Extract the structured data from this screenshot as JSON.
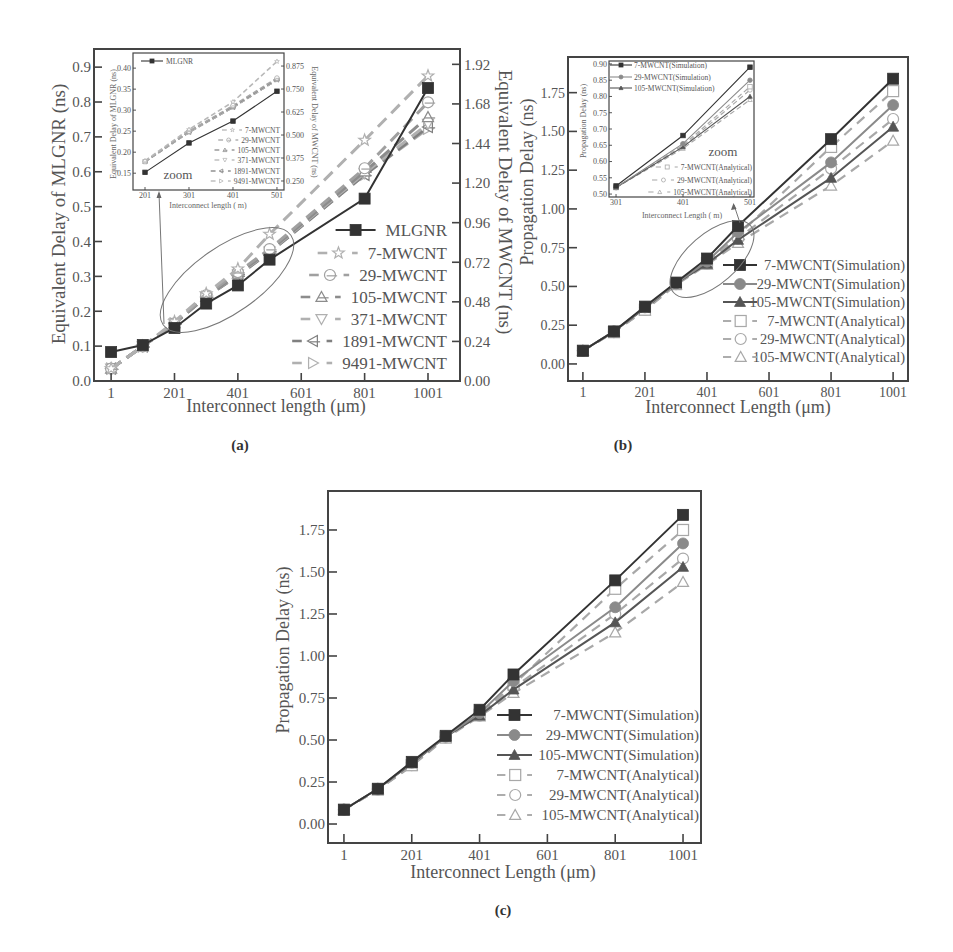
{
  "chart_data": [
    {
      "id": "a",
      "type": "line",
      "panel_label": "(a)",
      "xlabel": "Interconnect length (μm)",
      "ylabel": "Equivalent Delay of MLGNR (ns)",
      "y2label": "Equivalent Delay of MWCNT (ns)",
      "grid": false,
      "legend_position": "lower right",
      "xlim": [
        -53,
        1102
      ],
      "ylim": [
        0,
        0.952
      ],
      "y2lim": [
        0,
        2.013
      ],
      "xticks": [
        1,
        201,
        401,
        601,
        801,
        1001
      ],
      "xtick_labels": [
        "1",
        "201",
        "401",
        "601",
        "801",
        "1001"
      ],
      "yticks": [
        0,
        0.1,
        0.2,
        0.3,
        0.4,
        0.5,
        0.6,
        0.7,
        0.8,
        0.9
      ],
      "ytick_labels": [
        "0.0",
        "0.1",
        "0.2",
        "0.3",
        "0.4",
        "0.5",
        "0.6",
        "0.7",
        "0.8",
        "0.9"
      ],
      "y2ticks": [
        0,
        0.24,
        0.48,
        0.72,
        0.96,
        1.2,
        1.44,
        1.68,
        1.92
      ],
      "y2tick_labels": [
        "0.00",
        "0.24",
        "0.48",
        "0.72",
        "0.96",
        "1.20",
        "1.44",
        "1.68",
        "1.92"
      ],
      "x": [
        1,
        101,
        201,
        301,
        401,
        501,
        801,
        1001
      ],
      "series": [
        {
          "name": "MLGNR",
          "axis": "y",
          "values": [
            0.083,
            0.103,
            0.152,
            0.222,
            0.274,
            0.348,
            0.523,
            0.84
          ],
          "marker": "square",
          "line": "solid",
          "color": "#333333"
        },
        {
          "name": "7-MWCNT",
          "axis": "y2",
          "values": [
            0.075,
            0.21,
            0.36,
            0.53,
            0.68,
            0.89,
            1.46,
            1.85
          ],
          "marker": "star-open",
          "line": "dashed",
          "color": "#b0b0b0"
        },
        {
          "name": "29-MWCNT",
          "axis": "y2",
          "values": [
            0.075,
            0.21,
            0.35,
            0.52,
            0.66,
            0.8,
            1.29,
            1.69
          ],
          "marker": "circle-open-bar",
          "line": "dashed",
          "color": "#a0a0a0"
        },
        {
          "name": "105-MWCNT",
          "axis": "y2",
          "values": [
            0.075,
            0.21,
            0.35,
            0.51,
            0.65,
            0.79,
            1.27,
            1.6
          ],
          "marker": "triangle-up-open-bar",
          "line": "dashed",
          "color": "#8c8c8c"
        },
        {
          "name": "371-MWCNT",
          "axis": "y2",
          "values": [
            0.075,
            0.21,
            0.35,
            0.51,
            0.645,
            0.785,
            1.26,
            1.56
          ],
          "marker": "triangle-down-open",
          "line": "dashed",
          "color": "#b0b0b0"
        },
        {
          "name": "1891-MWCNT",
          "axis": "y2",
          "values": [
            0.075,
            0.21,
            0.35,
            0.51,
            0.64,
            0.78,
            1.25,
            1.54
          ],
          "marker": "triangle-left-open-bar",
          "line": "dashed",
          "color": "#808080"
        },
        {
          "name": "9491-MWCNT",
          "axis": "y2",
          "values": [
            0.075,
            0.21,
            0.35,
            0.51,
            0.64,
            0.78,
            1.25,
            1.53
          ],
          "marker": "triangle-right-open",
          "line": "dashed",
          "color": "#b0b0b0"
        }
      ],
      "inset": {
        "id": "a-inset",
        "type": "line",
        "annotation": "zoom",
        "xlabel": "Interconnect length ( m)",
        "ylabel": "Equivalent Delay of MLGNR (ns)",
        "y2label": "Equivalent Delay of MWCNT (ns)",
        "xlim": [
          173.7,
          517
        ],
        "ylim": [
          0.11,
          0.436
        ],
        "y2lim": [
          0.201,
          0.946
        ],
        "xticks": [
          201,
          301,
          401,
          501
        ],
        "xtick_labels": [
          "201",
          "301",
          "401",
          "501"
        ],
        "yticks": [
          0.15,
          0.2,
          0.25,
          0.3,
          0.35,
          0.4
        ],
        "ytick_labels": [
          "0.15",
          "0.20",
          "0.25",
          "0.30",
          "0.35",
          "0.40"
        ],
        "y2ticks": [
          0.25,
          0.375,
          0.5,
          0.625,
          0.75,
          0.875
        ],
        "y2tick_labels": [
          "0.250",
          "0.375",
          "0.500",
          "0.625",
          "0.750",
          "0.875"
        ],
        "x": [
          201,
          301,
          401,
          501
        ],
        "series": [
          {
            "name": "MLGNR",
            "axis": "y",
            "values": [
              0.152,
              0.222,
              0.274,
              0.345
            ],
            "marker": "square",
            "line": "solid",
            "color": "#333333"
          },
          {
            "name": "7-MWCNT",
            "axis": "y2",
            "values": [
              0.36,
              0.53,
              0.68,
              0.9
            ],
            "marker": "star-open",
            "line": "dashed",
            "color": "#b8b8b8"
          },
          {
            "name": "29-MWCNT",
            "axis": "y2",
            "values": [
              0.355,
              0.52,
              0.66,
              0.81
            ],
            "marker": "circle-open-bar",
            "line": "dashed",
            "color": "#a8a8a8"
          },
          {
            "name": "105-MWCNT",
            "axis": "y2",
            "values": [
              0.355,
              0.52,
              0.655,
              0.805
            ],
            "marker": "triangle-up-open-bar",
            "line": "dashed",
            "color": "#909090"
          },
          {
            "name": "371-MWCNT",
            "axis": "y2",
            "values": [
              0.355,
              0.515,
              0.65,
              0.8
            ],
            "marker": "triangle-down-open",
            "line": "dashed",
            "color": "#b8b8b8"
          },
          {
            "name": "1891-MWCNT",
            "axis": "y2",
            "values": [
              0.355,
              0.515,
              0.65,
              0.8
            ],
            "marker": "triangle-left-open-bar",
            "line": "dashed",
            "color": "#858585"
          },
          {
            "name": "9491-MWCNT",
            "axis": "y2",
            "values": [
              0.355,
              0.515,
              0.65,
              0.8
            ],
            "marker": "triangle-right-open",
            "line": "dashed",
            "color": "#b8b8b8"
          }
        ]
      }
    },
    {
      "id": "b",
      "type": "line",
      "panel_label": "(b)",
      "xlabel": "Interconnect Length (μm)",
      "ylabel": "Propagation Delay (ns)",
      "grid": false,
      "legend_position": "lower right",
      "xlim": [
        -47,
        1049
      ],
      "ylim": [
        -0.11,
        1.98
      ],
      "xticks": [
        1,
        201,
        401,
        601,
        801,
        1001
      ],
      "xtick_labels": [
        "1",
        "201",
        "401",
        "601",
        "801",
        "1001"
      ],
      "yticks": [
        0,
        0.25,
        0.5,
        0.75,
        1.0,
        1.25,
        1.5,
        1.75
      ],
      "ytick_labels": [
        "0.00",
        "0.25",
        "0.50",
        "0.75",
        "1.00",
        "1.25",
        "1.50",
        "1.75"
      ],
      "x": [
        1,
        101,
        201,
        301,
        401,
        501,
        801,
        1001
      ],
      "series": [
        {
          "name": "7-MWCNT(Simulation)",
          "values": [
            0.085,
            0.21,
            0.37,
            0.525,
            0.68,
            0.89,
            1.45,
            1.84
          ],
          "marker": "square",
          "line": "solid",
          "color": "#333333"
        },
        {
          "name": "29-MWCNT(Simulation)",
          "values": [
            0.085,
            0.21,
            0.365,
            0.52,
            0.66,
            0.85,
            1.3,
            1.67
          ],
          "marker": "circle",
          "line": "solid",
          "color": "#8a8a8a"
        },
        {
          "name": "105-MWCNT(Simulation)",
          "values": [
            0.085,
            0.21,
            0.36,
            0.52,
            0.645,
            0.8,
            1.2,
            1.53
          ],
          "marker": "triangle-up",
          "line": "solid",
          "color": "#555555"
        },
        {
          "name": "7-MWCNT(Analytical)",
          "values": [
            0.085,
            0.205,
            0.35,
            0.515,
            0.65,
            0.83,
            1.4,
            1.76
          ],
          "marker": "square-open",
          "line": "dashed",
          "color": "#a8a8a8"
        },
        {
          "name": "29-MWCNT(Analytical)",
          "values": [
            0.085,
            0.205,
            0.35,
            0.515,
            0.645,
            0.81,
            1.26,
            1.58
          ],
          "marker": "circle-open",
          "line": "dashed",
          "color": "#a8a8a8"
        },
        {
          "name": "105-MWCNT(Analytical)",
          "values": [
            0.085,
            0.205,
            0.345,
            0.51,
            0.64,
            0.78,
            1.15,
            1.44
          ],
          "marker": "triangle-up-open",
          "line": "dashed",
          "color": "#a8a8a8"
        }
      ],
      "inset": {
        "id": "b-inset",
        "type": "line",
        "annotation": "zoom",
        "xlabel": "Interconnect Length ( m)",
        "ylabel": "Propagation Delay (ns)",
        "xlim": [
          290.5,
          507
        ],
        "ylim": [
          0.491,
          0.909
        ],
        "xticks": [
          301,
          401,
          501
        ],
        "xtick_labels": [
          "301",
          "401",
          "501"
        ],
        "yticks": [
          0.5,
          0.55,
          0.6,
          0.65,
          0.7,
          0.75,
          0.8,
          0.85,
          0.9
        ],
        "ytick_labels": [
          "0.50",
          "0.55",
          "0.60",
          "0.65",
          "0.70",
          "0.75",
          "0.80",
          "0.85",
          "0.90"
        ],
        "x": [
          301,
          401,
          501
        ],
        "series": [
          {
            "name": "7-MWCNT(Simulation)",
            "values": [
              0.525,
              0.68,
              0.89
            ],
            "marker": "square",
            "line": "solid",
            "color": "#333333"
          },
          {
            "name": "29-MWCNT(Simulation)",
            "values": [
              0.52,
              0.655,
              0.85
            ],
            "marker": "circle",
            "line": "solid",
            "color": "#8a8a8a"
          },
          {
            "name": "105-MWCNT(Simulation)",
            "values": [
              0.52,
              0.645,
              0.8
            ],
            "marker": "triangle-up",
            "line": "solid",
            "color": "#555555"
          },
          {
            "name": "7-MWCNT(Analytical)",
            "values": [
              0.52,
              0.65,
              0.83
            ],
            "marker": "square-open",
            "line": "dashed",
            "color": "#a8a8a8"
          },
          {
            "name": "29-MWCNT(Analytical)",
            "values": [
              0.52,
              0.645,
              0.82
            ],
            "marker": "circle-open",
            "line": "dashed",
            "color": "#a8a8a8"
          },
          {
            "name": "105-MWCNT(Analytical)",
            "values": [
              0.52,
              0.64,
              0.79
            ],
            "marker": "triangle-up-open",
            "line": "dashed",
            "color": "#a8a8a8"
          }
        ]
      }
    },
    {
      "id": "c",
      "type": "line",
      "panel_label": "(c)",
      "xlabel": "Interconnect Length (μm)",
      "ylabel": "Propagation Delay (ns)",
      "grid": false,
      "legend_position": "lower right",
      "xlim": [
        -46,
        1054
      ],
      "ylim": [
        -0.113,
        1.982
      ],
      "xticks": [
        1,
        201,
        401,
        601,
        801,
        1001
      ],
      "xtick_labels": [
        "1",
        "201",
        "401",
        "601",
        "801",
        "1001"
      ],
      "yticks": [
        0,
        0.25,
        0.5,
        0.75,
        1.0,
        1.25,
        1.5,
        1.75
      ],
      "ytick_labels": [
        "0.00",
        "0.25",
        "0.50",
        "0.75",
        "1.00",
        "1.25",
        "1.50",
        "1.75"
      ],
      "x": [
        1,
        101,
        201,
        301,
        401,
        501,
        801,
        1001
      ],
      "series": [
        {
          "name": "7-MWCNT(Simulation)",
          "values": [
            0.085,
            0.21,
            0.37,
            0.525,
            0.68,
            0.89,
            1.45,
            1.84
          ],
          "marker": "square",
          "line": "solid",
          "color": "#333333"
        },
        {
          "name": "29-MWCNT(Simulation)",
          "values": [
            0.085,
            0.21,
            0.365,
            0.52,
            0.66,
            0.85,
            1.29,
            1.67
          ],
          "marker": "circle",
          "line": "solid",
          "color": "#8a8a8a"
        },
        {
          "name": "105-MWCNT(Simulation)",
          "values": [
            0.085,
            0.21,
            0.36,
            0.52,
            0.645,
            0.8,
            1.2,
            1.53
          ],
          "marker": "triangle-up",
          "line": "solid",
          "color": "#555555"
        },
        {
          "name": "7-MWCNT(Analytical)",
          "values": [
            0.085,
            0.205,
            0.35,
            0.515,
            0.65,
            0.83,
            1.4,
            1.75
          ],
          "marker": "square-open",
          "line": "dashed",
          "color": "#a8a8a8"
        },
        {
          "name": "29-MWCNT(Analytical)",
          "values": [
            0.085,
            0.205,
            0.35,
            0.515,
            0.645,
            0.81,
            1.25,
            1.58
          ],
          "marker": "circle-open",
          "line": "dashed",
          "color": "#a8a8a8"
        },
        {
          "name": "105-MWCNT(Analytical)",
          "values": [
            0.085,
            0.205,
            0.345,
            0.51,
            0.64,
            0.78,
            1.14,
            1.44
          ],
          "marker": "triangle-up-open",
          "line": "dashed",
          "color": "#a8a8a8"
        }
      ]
    }
  ]
}
